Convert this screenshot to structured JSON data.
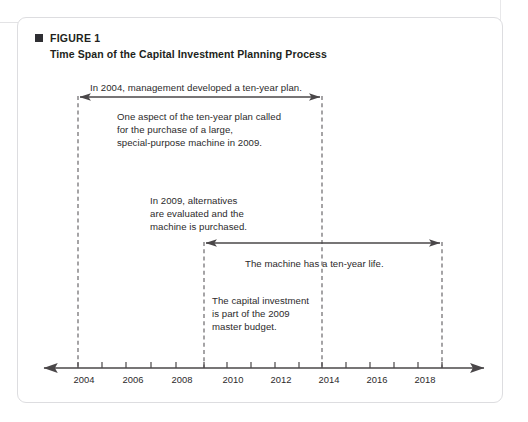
{
  "figure": {
    "bullet_icon": "filled-square-icon",
    "label": "FIGURE 1",
    "title": "Time Span of the Capital Investment Planning Process"
  },
  "notes": {
    "plan": "In 2004, management developed a ten-year plan.",
    "aspect": "One aspect of the ten-year plan called\nfor the purchase of a large,\nspecial-purpose machine in 2009.",
    "alternatives": "In 2009, alternatives\nare evaluated and the\nmachine is purchased.",
    "machine_life": "The machine has a ten-year life.",
    "capital": "The capital investment\nis part of the 2009\nmaster budget."
  },
  "timeline": {
    "axis_label": "Years",
    "tick_years": [
      2004,
      2005,
      2006,
      2007,
      2008,
      2009,
      2010,
      2011,
      2012,
      2013,
      2014,
      2015,
      2016,
      2017,
      2018,
      2019
    ],
    "labeled_years": [
      "2004",
      "2006",
      "2008",
      "2010",
      "2012",
      "2014",
      "2016",
      "2018"
    ],
    "marker_years": [
      2004,
      2009,
      2014,
      2019
    ],
    "spans": [
      {
        "name": "ten-year-plan-span",
        "from": 2004,
        "to": 2014,
        "label": "In 2004, management developed a ten-year plan."
      },
      {
        "name": "machine-life-span",
        "from": 2009,
        "to": 2019,
        "label": "The machine has a ten-year life."
      }
    ],
    "axis_color": "#4a4749",
    "marker_color": "#5c5a5d"
  },
  "colors": {
    "text": "#2c2a2b",
    "heading": "#221f20",
    "frame_border": "#dddde0",
    "bullet": "#2f2f33"
  }
}
